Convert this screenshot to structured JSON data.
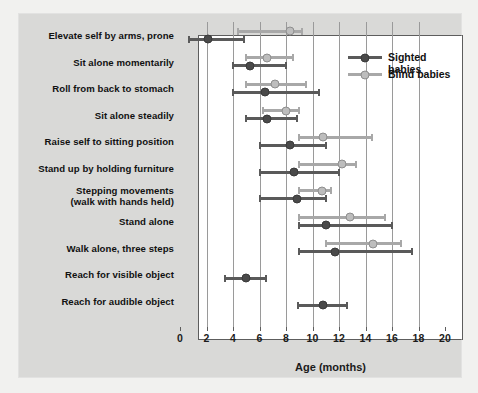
{
  "chart_data": {
    "type": "scatter",
    "title": "",
    "xlabel": "Age (months)",
    "ylabel": "",
    "xlim": [
      0,
      20
    ],
    "xticks": [
      0,
      2,
      4,
      6,
      8,
      10,
      12,
      14,
      16,
      18,
      20
    ],
    "grid": "vertical",
    "legend_position": "top-right",
    "legend": [
      {
        "name": "Sighted babies",
        "color": "#5a5a5a"
      },
      {
        "name": "Blind babies",
        "color": "#a8a8a8"
      }
    ],
    "categories": [
      "Elevate self by arms, prone",
      "Sit alone momentarily",
      "Roll from back to stomach",
      "Sit alone steadily",
      "Raise self to sitting position",
      "Stand up by holding furniture",
      "Stepping movements\n(walk with hands held)",
      "Stand alone",
      "Walk alone, three steps",
      "Reach for visible object",
      "Reach for audible object"
    ],
    "series": [
      {
        "name": "Sighted babies",
        "color": "#5a5a5a",
        "points": [
          {
            "category": "Elevate self by arms, prone",
            "median": 2.1,
            "low": 0.7,
            "high": 4.8
          },
          {
            "category": "Sit alone momentarily",
            "median": 5.3,
            "low": 4.0,
            "high": 8.0
          },
          {
            "category": "Roll from back to stomach",
            "median": 6.4,
            "low": 4.0,
            "high": 10.5
          },
          {
            "category": "Sit alone steadily",
            "median": 6.6,
            "low": 5.0,
            "high": 8.8
          },
          {
            "category": "Raise self to sitting position",
            "median": 8.3,
            "low": 6.0,
            "high": 11.0
          },
          {
            "category": "Stand up by holding furniture",
            "median": 8.6,
            "low": 6.0,
            "high": 12.0
          },
          {
            "category": "Stepping movements\n(walk with hands held)",
            "median": 8.8,
            "low": 6.0,
            "high": 11.0
          },
          {
            "category": "Stand alone",
            "median": 11.0,
            "low": 9.0,
            "high": 16.0
          },
          {
            "category": "Walk alone, three steps",
            "median": 11.7,
            "low": 9.0,
            "high": 17.5
          },
          {
            "category": "Reach for visible object",
            "median": 5.0,
            "low": 3.4,
            "high": 6.5
          },
          {
            "category": "Reach for audible object",
            "median": 10.8,
            "low": 8.9,
            "high": 12.6
          }
        ]
      },
      {
        "name": "Blind babies",
        "color": "#a8a8a8",
        "points": [
          {
            "category": "Elevate self by arms, prone",
            "median": 8.3,
            "low": 4.4,
            "high": 9.2
          },
          {
            "category": "Sit alone momentarily",
            "median": 6.6,
            "low": 5.0,
            "high": 8.5
          },
          {
            "category": "Roll from back to stomach",
            "median": 7.2,
            "low": 5.0,
            "high": 9.5
          },
          {
            "category": "Sit alone steadily",
            "median": 8.0,
            "low": 6.3,
            "high": 9.0
          },
          {
            "category": "Raise self to sitting position",
            "median": 10.8,
            "low": 9.0,
            "high": 14.5
          },
          {
            "category": "Stand up by holding furniture",
            "median": 12.2,
            "low": 9.0,
            "high": 13.3
          },
          {
            "category": "Stepping movements\n(walk with hands held)",
            "median": 10.7,
            "low": 9.0,
            "high": 11.4
          },
          {
            "category": "Stand alone",
            "median": 12.8,
            "low": 9.0,
            "high": 15.5
          },
          {
            "category": "Walk alone, three steps",
            "median": 14.6,
            "low": 11.0,
            "high": 16.7
          }
        ]
      }
    ]
  }
}
